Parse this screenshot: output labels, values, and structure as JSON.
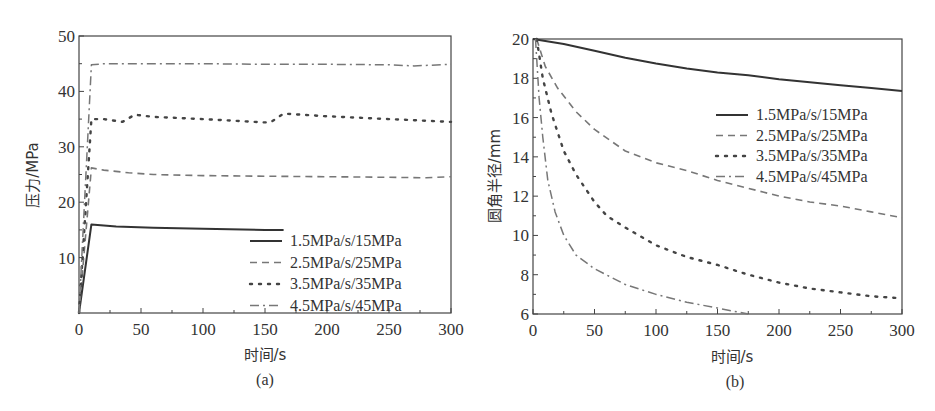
{
  "chart_data": [
    {
      "panel": "(a)",
      "type": "line",
      "title": "",
      "xlabel": "时间/s",
      "ylabel": "压力/MPa",
      "xlim": [
        0,
        300
      ],
      "ylim": [
        0,
        50
      ],
      "xticks": [
        0,
        50,
        100,
        150,
        200,
        250,
        300
      ],
      "yticks": [
        10,
        20,
        30,
        40,
        50
      ],
      "ytick_labels_shown": [
        "10",
        "20",
        "30",
        "40",
        "50"
      ],
      "grid": false,
      "legend_position": "lower right",
      "series": [
        {
          "name": "1.5MPa/s/15MPa",
          "style": "solid",
          "x": [
            0,
            10,
            30,
            60,
            100,
            150,
            165
          ],
          "y": [
            0,
            16,
            15.6,
            15.4,
            15.2,
            15.0,
            15.0
          ]
        },
        {
          "name": "2.5MPa/s/25MPa",
          "style": "dashed",
          "x": [
            0,
            10,
            20,
            40,
            60,
            100,
            150,
            200,
            250,
            280,
            300
          ],
          "y": [
            0,
            26.2,
            25.8,
            25.3,
            25.0,
            24.8,
            24.7,
            24.6,
            24.5,
            24.4,
            24.6
          ]
        },
        {
          "name": "3.5MPa/s/35MPa",
          "style": "dotted",
          "x": [
            0,
            10,
            20,
            35,
            45,
            60,
            100,
            150,
            155,
            165,
            200,
            250,
            300
          ],
          "y": [
            0,
            35,
            35,
            34.5,
            35.8,
            35.4,
            35.0,
            34.4,
            34.5,
            36.0,
            35.5,
            35.0,
            34.5
          ]
        },
        {
          "name": "4.5MPa/s/45MPa",
          "style": "dashdot",
          "x": [
            0,
            10,
            20,
            40,
            100,
            150,
            200,
            250,
            270,
            300
          ],
          "y": [
            0,
            44.8,
            45.0,
            45.0,
            45.0,
            44.9,
            44.9,
            44.8,
            44.6,
            44.9
          ]
        }
      ]
    },
    {
      "panel": "(b)",
      "type": "line",
      "title": "",
      "xlabel": "时间/s",
      "ylabel": "圆角半径/mm",
      "xlim": [
        0,
        300
      ],
      "ylim": [
        6,
        20
      ],
      "xticks": [
        0,
        50,
        100,
        150,
        200,
        250,
        300
      ],
      "yticks": [
        6,
        8,
        10,
        12,
        14,
        16,
        18,
        20
      ],
      "grid": false,
      "legend_position": "upper right",
      "series": [
        {
          "name": "1.5MPa/s/15MPa",
          "style": "solid",
          "x": [
            0,
            25,
            50,
            75,
            100,
            125,
            150,
            175,
            200,
            225,
            250,
            275,
            300
          ],
          "y": [
            20,
            19.75,
            19.4,
            19.05,
            18.75,
            18.5,
            18.3,
            18.15,
            17.95,
            17.8,
            17.65,
            17.5,
            17.35
          ]
        },
        {
          "name": "2.5MPa/s/25MPa",
          "style": "dashed",
          "x": [
            3,
            10,
            20,
            35,
            50,
            75,
            100,
            125,
            150,
            175,
            200,
            225,
            250,
            275,
            300
          ],
          "y": [
            20,
            18.6,
            17.5,
            16.3,
            15.4,
            14.3,
            13.7,
            13.3,
            12.8,
            12.4,
            12.0,
            11.7,
            11.5,
            11.2,
            10.9
          ]
        },
        {
          "name": "3.5MPa/s/35MPa",
          "style": "dotted",
          "x": [
            3,
            8,
            15,
            25,
            35,
            50,
            60,
            75,
            100,
            125,
            150,
            175,
            200,
            225,
            250,
            275,
            300
          ],
          "y": [
            20,
            18,
            16.2,
            14.3,
            13.1,
            11.7,
            11.0,
            10.4,
            9.5,
            8.9,
            8.5,
            8.0,
            7.6,
            7.3,
            7.1,
            6.9,
            6.8
          ]
        },
        {
          "name": "4.5MPa/s/45MPa",
          "style": "dashdot",
          "x": [
            2,
            5,
            8,
            12,
            18,
            25,
            35,
            50,
            75,
            100,
            125,
            150,
            175
          ],
          "y": [
            20,
            17,
            15.0,
            12.8,
            11.2,
            10.0,
            9.0,
            8.3,
            7.5,
            7.0,
            6.6,
            6.3,
            6.0
          ]
        }
      ]
    }
  ],
  "panels": {
    "a": {
      "label": "(a)",
      "xlabel": "时间/s",
      "ylabel": "压力/MPa",
      "xtick_labels": [
        "0",
        "50",
        "100",
        "150",
        "200",
        "250",
        "300"
      ],
      "ytick_labels": [
        "10",
        "20",
        "30",
        "40",
        "50"
      ],
      "legend": [
        "1.5MPa/s/15MPa",
        "2.5MPa/s/25MPa",
        "3.5MPa/s/35MPa",
        "4.5MPa/s/45MPa"
      ]
    },
    "b": {
      "label": "(b)",
      "xlabel": "时间/s",
      "ylabel": "圆角半径/mm",
      "xtick_labels": [
        "0",
        "50",
        "100",
        "150",
        "200",
        "250",
        "300"
      ],
      "ytick_labels": [
        "6",
        "8",
        "10",
        "12",
        "14",
        "16",
        "18",
        "20"
      ],
      "legend": [
        "1.5MPa/s/15MPa",
        "2.5MPa/s/25MPa",
        "3.5MPa/s/35MPa",
        "4.5MPa/s/45MPa"
      ]
    }
  },
  "colors": {
    "line_solid": "#333333",
    "line_dashed": "#777777",
    "line_dotted": "#444444",
    "line_dashdot": "#777777",
    "axis": "#444444"
  }
}
